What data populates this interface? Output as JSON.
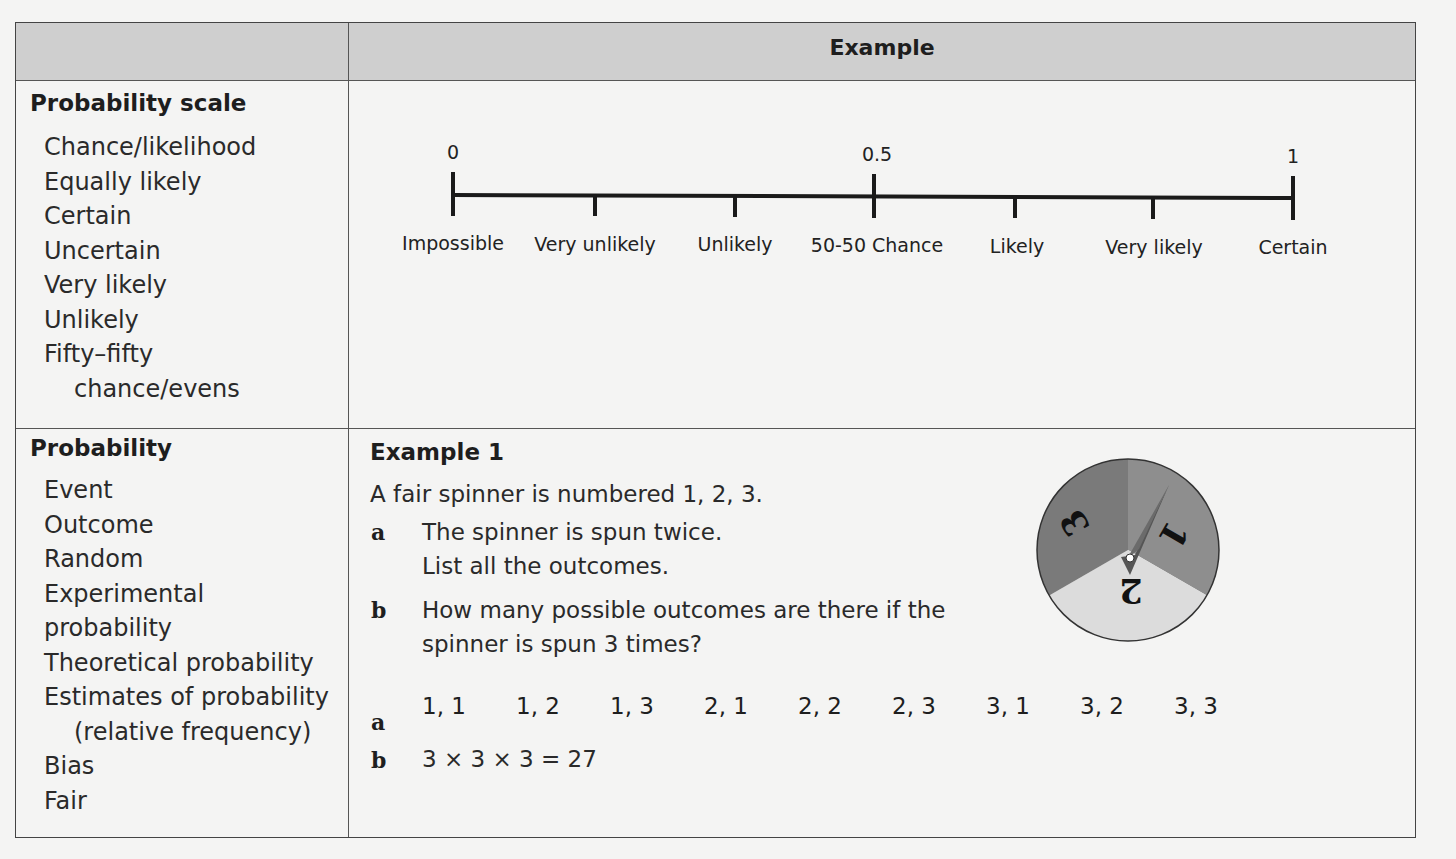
{
  "header": {
    "left": "",
    "right": "Example"
  },
  "section1": {
    "title": "Probability scale",
    "keywords": [
      "Chance/likelihood",
      "Equally likely",
      "Certain",
      "Uncertain",
      "Very likely",
      "Unlikely",
      "Fifty–fifty",
      "chance/evens"
    ],
    "scale": {
      "values": [
        "0",
        "0.5",
        "1"
      ],
      "labels": [
        "Impossible",
        "Very unlikely",
        "Unlikely",
        "50-50 Chance",
        "Likely",
        "Very likely",
        "Certain"
      ]
    }
  },
  "section2": {
    "title": "Probability",
    "keywords": [
      "Event",
      "Outcome",
      "Random",
      "Experimental",
      "probability",
      "Theoretical probability",
      "Estimates of probability",
      "(relative frequency)",
      "Bias",
      "Fair"
    ],
    "example": {
      "title": "Example 1",
      "intro": "A fair spinner is numbered 1, 2, 3.",
      "questions": [
        {
          "label": "a",
          "lines": [
            "The spinner is spun twice.",
            "List all the outcomes."
          ]
        },
        {
          "label": "b",
          "lines": [
            "How many possible outcomes are there if the",
            "spinner is spun 3 times?"
          ]
        }
      ],
      "answers": {
        "a_label": "a",
        "a_outcomes": [
          "1, 1",
          "1, 2",
          "1, 3",
          "2, 1",
          "2, 2",
          "2, 3",
          "3, 1",
          "3, 2",
          "3, 3"
        ],
        "b_label": "b",
        "b_text": "3 × 3 × 3 = 27"
      },
      "spinner": {
        "sectors": [
          "1",
          "2",
          "3"
        ],
        "colors": {
          "s1": "#8e8e8e",
          "s2": "#dcdcdc",
          "s3": "#7a7a7a"
        }
      }
    }
  }
}
